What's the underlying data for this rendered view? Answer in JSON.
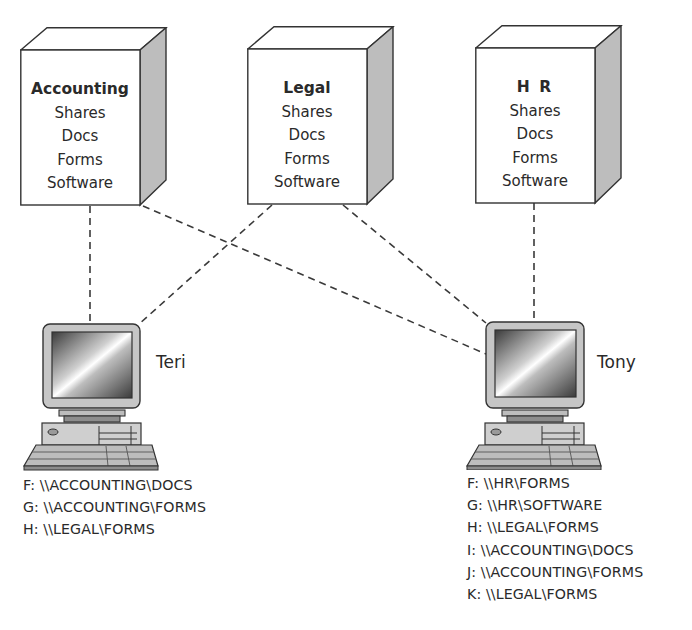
{
  "servers": [
    {
      "name": "Accounting",
      "items": [
        "Shares",
        "Docs",
        "Forms",
        "Software"
      ]
    },
    {
      "name": "Legal",
      "items": [
        "Shares",
        "Docs",
        "Forms",
        "Software"
      ]
    },
    {
      "name": "H R",
      "items": [
        "Shares",
        "Docs",
        "Forms",
        "Software"
      ]
    }
  ],
  "computers": [
    {
      "user": "Teri",
      "mappings": [
        "F: \\\\ACCOUNTING\\DOCS",
        "G: \\\\ACCOUNTING\\FORMS",
        "H: \\\\LEGAL\\FORMS"
      ]
    },
    {
      "user": "Tony",
      "mappings": [
        "F: \\\\HR\\FORMS",
        "G: \\\\HR\\SOFTWARE",
        "H: \\\\LEGAL\\FORMS",
        "I: \\\\ACCOUNTING\\DOCS",
        "J: \\\\ACCOUNTING\\FORMS",
        "K: \\\\LEGAL\\FORMS"
      ]
    }
  ],
  "connections": [
    {
      "from": "Accounting",
      "to": "Teri"
    },
    {
      "from": "Accounting",
      "to": "Tony"
    },
    {
      "from": "Legal",
      "to": "Teri"
    },
    {
      "from": "Legal",
      "to": "Tony"
    },
    {
      "from": "H R",
      "to": "Tony"
    }
  ],
  "colors": {
    "line": "#3a3a3a",
    "box_side": "#bdbdbd",
    "text": "#2a2a2a"
  }
}
